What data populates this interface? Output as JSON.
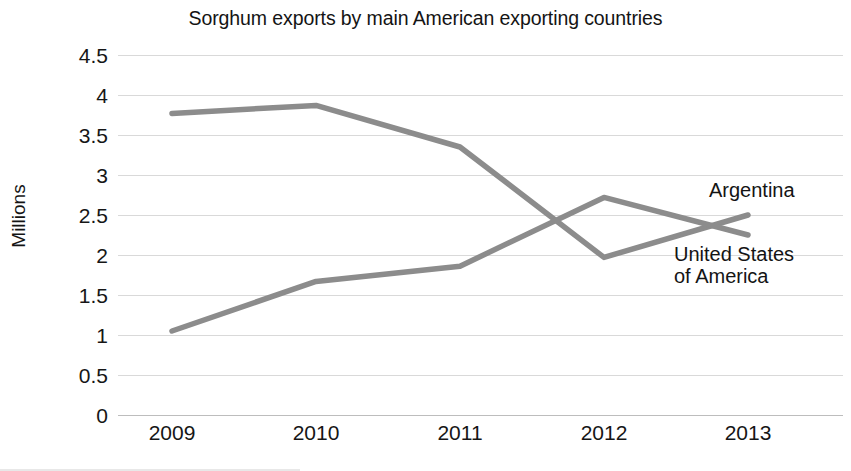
{
  "chart_data": {
    "type": "line",
    "title": "Sorghum exports by main American exporting countries",
    "xlabel": "",
    "ylabel": "Millions",
    "categories": [
      "2009",
      "2010",
      "2011",
      "2012",
      "2013"
    ],
    "x_tick_labels": [
      "2009",
      "2010",
      "2011",
      "2012",
      "2013"
    ],
    "y_tick_labels": [
      "4.5",
      "4",
      "3.5",
      "3",
      "2.5",
      "2",
      "1.5",
      "1",
      "0.5",
      "0"
    ],
    "y_tick_values": [
      4.5,
      4,
      3.5,
      3,
      2.5,
      2,
      1.5,
      1,
      0.5,
      0
    ],
    "ylim": [
      0,
      4.5
    ],
    "grid": true,
    "legend_position": "inline-right-labels",
    "series": [
      {
        "name": "Argentina",
        "label": "Argentina",
        "color": "#8c8c8c",
        "values": [
          3.77,
          3.87,
          3.35,
          1.97,
          2.5
        ]
      },
      {
        "name": "United States of America",
        "label": "United States of America",
        "label_line_1": "United States",
        "label_line_2": "of America",
        "color": "#8c8c8c",
        "values": [
          1.05,
          1.67,
          1.86,
          2.72,
          2.25
        ]
      }
    ]
  }
}
